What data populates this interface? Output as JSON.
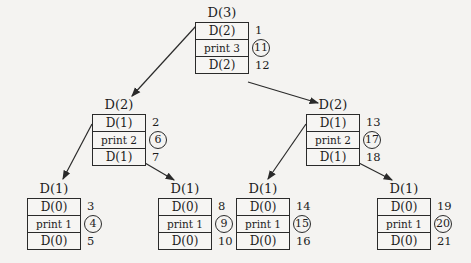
{
  "nodes": {
    "root": {
      "title": "D(3)",
      "cells": [
        "D(2)",
        "print 3",
        "D(2)"
      ],
      "steps": [
        "1",
        "11",
        "12"
      ]
    },
    "l": {
      "title": "D(2)",
      "cells": [
        "D(1)",
        "print 2",
        "D(1)"
      ],
      "steps": [
        "2",
        "6",
        "7"
      ]
    },
    "r": {
      "title": "D(2)",
      "cells": [
        "D(1)",
        "print 2",
        "D(1)"
      ],
      "steps": [
        "13",
        "17",
        "18"
      ]
    },
    "ll": {
      "title": "D(1)",
      "cells": [
        "D(0)",
        "print 1",
        "D(0)"
      ],
      "steps": [
        "3",
        "4",
        "5"
      ]
    },
    "lr": {
      "title": "D(1)",
      "cells": [
        "D(0)",
        "print 1",
        "D(0)"
      ],
      "steps": [
        "8",
        "9",
        "10"
      ]
    },
    "rl": {
      "title": "D(1)",
      "cells": [
        "D(0)",
        "print 1",
        "D(0)"
      ],
      "steps": [
        "14",
        "15",
        "16"
      ]
    },
    "rr": {
      "title": "D(1)",
      "cells": [
        "D(0)",
        "print 1",
        "D(0)"
      ],
      "steps": [
        "19",
        "20",
        "21"
      ]
    }
  },
  "legend": {
    "circled_meaning": "print step"
  },
  "colors": {
    "line": "#2a2a2a",
    "background": "#f4f3f1"
  }
}
